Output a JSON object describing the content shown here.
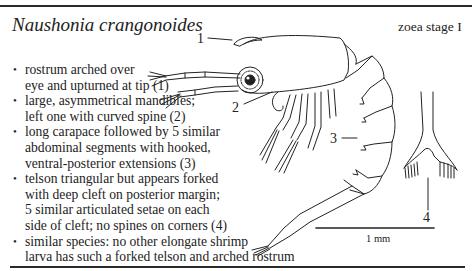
{
  "header": {
    "species": "Naushonia crangonoides",
    "stage": "zoea stage I"
  },
  "features": [
    {
      "lines": [
        "rostrum arched over",
        "eye and upturned at tip (1)"
      ]
    },
    {
      "lines": [
        "large, asymmetrical mandibles;",
        "left one with curved spine (2)"
      ]
    },
    {
      "lines": [
        "long carapace followed by 5 similar",
        "abdominal segments with hooked,",
        "ventral-posterior extensions (3)"
      ]
    },
    {
      "lines": [
        "telson triangular but appears forked",
        "with deep cleft on posterior margin;",
        "5 similar articulated setae on each",
        "side of cleft; no spines on corners (4)"
      ]
    },
    {
      "lines": [
        "similar species: no other elongate shrimp",
        "larva has such a forked telson and arched rostrum"
      ]
    }
  ],
  "figure": {
    "callouts": [
      "1",
      "2",
      "3",
      "4"
    ],
    "scale_bar_label": "1 mm"
  },
  "bullet_glyph": "•",
  "colors": {
    "ink": "#222222",
    "background": "#ffffff"
  }
}
